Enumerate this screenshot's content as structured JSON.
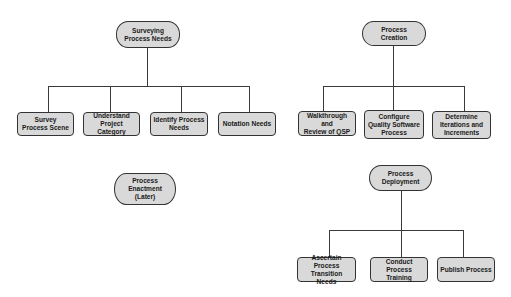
{
  "diagram": {
    "groups": [
      {
        "root": "Surveying\nProcess Needs",
        "children": [
          "Survey\nProcess Scene",
          "Understand\nProject Category",
          "Identify Process\nNeeds",
          "Notation Needs"
        ]
      },
      {
        "root": "Process\nCreation",
        "children": [
          "Walkthrough and\nReview of QSP",
          "Configure\nQuality Software\nProcess",
          "Determine\nIterations and\nIncrements"
        ]
      },
      {
        "root": "Process\nEnactment\n(Later)",
        "children": []
      },
      {
        "root": "Process\nDeployment",
        "children": [
          "Ascertain Process\nTransition Needs",
          "Conduct Process\nTraining",
          "Publish Process"
        ]
      }
    ],
    "colors": {
      "node_fill": "#d9d9d9",
      "border": "#333333",
      "line": "#3a3a3a"
    }
  }
}
